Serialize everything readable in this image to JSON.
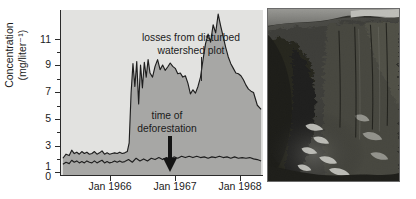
{
  "figure": {
    "panels": [
      "chart",
      "photograph"
    ]
  },
  "chart_data": {
    "type": "line",
    "title": "",
    "xlabel": "",
    "ylabel": "Concentration (mg/liter⁻¹)",
    "ylabel_line1": "Concentration",
    "ylabel_line2": "(mg/liter⁻¹)",
    "ylim": [
      0,
      12.3
    ],
    "ytick_labels": [
      "0",
      "1",
      "3",
      "5",
      "7",
      "9",
      "11"
    ],
    "ytick_values": [
      0,
      1,
      3,
      5,
      7,
      9,
      11
    ],
    "yminor_values": [
      2,
      4,
      6,
      8,
      10,
      12
    ],
    "xlim": [
      1965.25,
      1968.45
    ],
    "xtick_labels": [
      "Jan 1966",
      "Jan 1967",
      "Jan 1968"
    ],
    "xtick_values": [
      1966.0,
      1967.0,
      1968.0
    ],
    "grid": false,
    "legend": "none",
    "annotations": [
      {
        "name": "losses-from-disturbed-watershed-plot",
        "line1": "losses from disturbed",
        "line2": "watershed plot",
        "points_to_x": 1966.45,
        "points_to_y": 8.6
      },
      {
        "name": "time-of-deforestation",
        "line1": "time of",
        "line2": "deforestation",
        "points_to_x": 1965.97,
        "points_to_y": 1.7,
        "marker": "down-arrow"
      }
    ],
    "series": [
      {
        "name": "disturbed watershed plot",
        "fill_color": "#a7a7a5",
        "line_color": "#1e1e1e",
        "x": [
          1965.28,
          1965.33,
          1965.38,
          1965.42,
          1965.46,
          1965.5,
          1965.54,
          1965.58,
          1965.62,
          1965.66,
          1965.7,
          1965.74,
          1965.78,
          1965.82,
          1965.86,
          1965.9,
          1965.94,
          1965.98,
          1966.02,
          1966.06,
          1966.1,
          1966.14,
          1966.18,
          1966.22,
          1966.26,
          1966.3,
          1966.33,
          1966.36,
          1966.39,
          1966.42,
          1966.45,
          1966.48,
          1966.51,
          1966.54,
          1966.57,
          1966.6,
          1966.63,
          1966.66,
          1966.7,
          1966.74,
          1966.78,
          1966.82,
          1966.86,
          1966.9,
          1966.94,
          1966.98,
          1967.02,
          1967.06,
          1967.1,
          1967.14,
          1967.18,
          1967.22,
          1967.26,
          1967.3,
          1967.34,
          1967.38,
          1967.42,
          1967.46,
          1967.5,
          1967.54,
          1967.58,
          1967.62,
          1967.66,
          1967.7,
          1967.74,
          1967.78,
          1967.82,
          1967.86,
          1967.9,
          1967.94,
          1967.98,
          1968.02,
          1968.06,
          1968.1,
          1968.14,
          1968.18,
          1968.22,
          1968.26,
          1968.3,
          1968.36,
          1968.42
        ],
        "y": [
          1.25,
          1.55,
          1.45,
          1.85,
          1.6,
          1.7,
          1.55,
          1.75,
          1.6,
          1.7,
          1.55,
          1.6,
          1.75,
          1.55,
          1.65,
          1.8,
          1.55,
          1.65,
          1.55,
          1.6,
          1.65,
          1.6,
          1.7,
          1.6,
          1.65,
          1.75,
          2.4,
          6.1,
          8.3,
          6.6,
          8.45,
          5.3,
          8.2,
          6.5,
          8.4,
          7.3,
          8.6,
          7.6,
          7.3,
          8.1,
          8.6,
          7.85,
          8.2,
          7.8,
          8.05,
          8.35,
          8.1,
          7.95,
          7.55,
          7.6,
          7.3,
          7.4,
          6.85,
          6.05,
          6.35,
          6.1,
          6.6,
          7.3,
          8.6,
          9.8,
          10.5,
          9.9,
          11.2,
          10.6,
          12.0,
          11.1,
          10.3,
          9.5,
          8.8,
          8.3,
          7.95,
          7.6,
          7.55,
          7.4,
          7.1,
          6.7,
          6.4,
          6.25,
          6.15,
          5.2,
          4.9
        ]
      },
      {
        "name": "undisturbed reference watershed",
        "line_color": "#1e1e1e",
        "x": [
          1965.28,
          1965.33,
          1965.38,
          1965.42,
          1965.46,
          1965.5,
          1965.54,
          1965.58,
          1965.62,
          1965.66,
          1965.7,
          1965.74,
          1965.78,
          1965.82,
          1965.86,
          1965.9,
          1965.94,
          1965.98,
          1966.02,
          1966.06,
          1966.1,
          1966.14,
          1966.18,
          1966.22,
          1966.26,
          1966.32,
          1966.38,
          1966.44,
          1966.5,
          1966.56,
          1966.62,
          1966.68,
          1966.74,
          1966.8,
          1966.86,
          1966.92,
          1966.98,
          1967.04,
          1967.1,
          1967.16,
          1967.22,
          1967.28,
          1967.34,
          1967.4,
          1967.46,
          1967.52,
          1967.58,
          1967.64,
          1967.7,
          1967.76,
          1967.82,
          1967.88,
          1967.94,
          1968.0,
          1968.06,
          1968.12,
          1968.18,
          1968.24,
          1968.3,
          1968.36,
          1968.42
        ],
        "y": [
          0.8,
          0.95,
          0.85,
          1.1,
          0.95,
          1.05,
          0.9,
          1.0,
          0.9,
          1.05,
          0.95,
          0.9,
          1.05,
          0.9,
          1.0,
          1.1,
          0.9,
          1.0,
          0.9,
          0.95,
          1.05,
          0.95,
          1.05,
          0.95,
          1.0,
          1.15,
          0.95,
          1.25,
          1.05,
          1.2,
          1.05,
          1.25,
          1.15,
          1.3,
          1.15,
          1.3,
          1.2,
          1.35,
          1.25,
          1.4,
          1.3,
          1.4,
          1.3,
          1.4,
          1.3,
          1.35,
          1.25,
          1.35,
          1.3,
          1.4,
          1.3,
          1.35,
          1.25,
          1.35,
          1.25,
          1.3,
          1.25,
          1.3,
          1.2,
          1.15,
          1.05
        ]
      }
    ]
  },
  "photograph": {
    "name": "deforested-watershed-photo",
    "description": "black and white photograph of a forested hillside valley"
  }
}
